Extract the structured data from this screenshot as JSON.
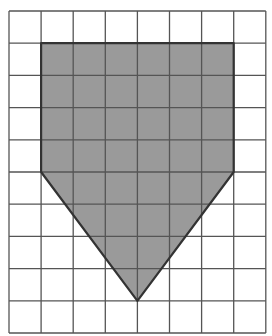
{
  "diagram": {
    "type": "grid-polygon",
    "grid": {
      "columns": 8,
      "rows": 10,
      "origin_x": 9,
      "origin_y": 11,
      "cell_w": 32.1,
      "cell_h": 32.2,
      "line_color": "#555555"
    },
    "shape": {
      "name": "pentagon (home-plate)",
      "fill": "#9a9a9a",
      "stroke": "#333333",
      "vertices_grid": [
        [
          1,
          1
        ],
        [
          7,
          1
        ],
        [
          7,
          5
        ],
        [
          4,
          9
        ],
        [
          1,
          5
        ]
      ]
    }
  }
}
